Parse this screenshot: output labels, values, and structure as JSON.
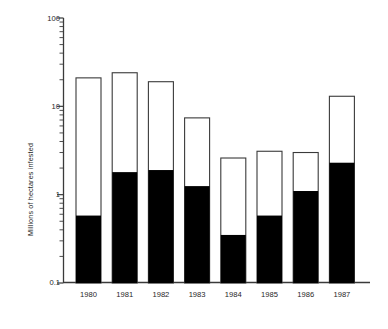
{
  "chart_data": {
    "type": "bar",
    "title": "",
    "subtitle": "",
    "xlabel": "",
    "ylabel": "Millions of hectares infested",
    "yscale": "log",
    "ylim": [
      0.1,
      100
    ],
    "ytick_labels": [
      "100",
      "10",
      "1",
      "0.1"
    ],
    "ytick_values": [
      100,
      10,
      1,
      0.1
    ],
    "grid": false,
    "legend": "none",
    "categories": [
      "1980",
      "1981",
      "1982",
      "1983",
      "1984",
      "1985",
      "1986",
      "1987"
    ],
    "series": [
      {
        "name": "infested",
        "fill": "#000000",
        "values": [
          0.58,
          1.8,
          1.9,
          1.25,
          0.35,
          0.58,
          1.1,
          2.3
        ]
      },
      {
        "name": "total",
        "fill": "#ffffff",
        "values": [
          21,
          24,
          19,
          7.4,
          2.6,
          3.1,
          3.0,
          13
        ]
      }
    ],
    "annotations": []
  },
  "axes": {
    "y_title": "Millions of hectares infested",
    "y_ticks": [
      {
        "label": "100",
        "value": 100
      },
      {
        "label": "10",
        "value": 10
      },
      {
        "label": "1",
        "value": 1
      },
      {
        "label": "0.1",
        "value": 0.1
      }
    ],
    "x_ticks": [
      {
        "label": "1980"
      },
      {
        "label": "1981"
      },
      {
        "label": "1982"
      },
      {
        "label": "1983"
      },
      {
        "label": "1984"
      },
      {
        "label": "1985"
      },
      {
        "label": "1986"
      },
      {
        "label": "1987"
      }
    ]
  },
  "colors": {
    "axis": "#3a3a3a",
    "bar_outline": "#3a3a3a",
    "bar_fill_solid": "#0a0a0a",
    "bar_fill_open": "#ffffff",
    "background": "#ffffff",
    "text": "#1f1f1f"
  }
}
